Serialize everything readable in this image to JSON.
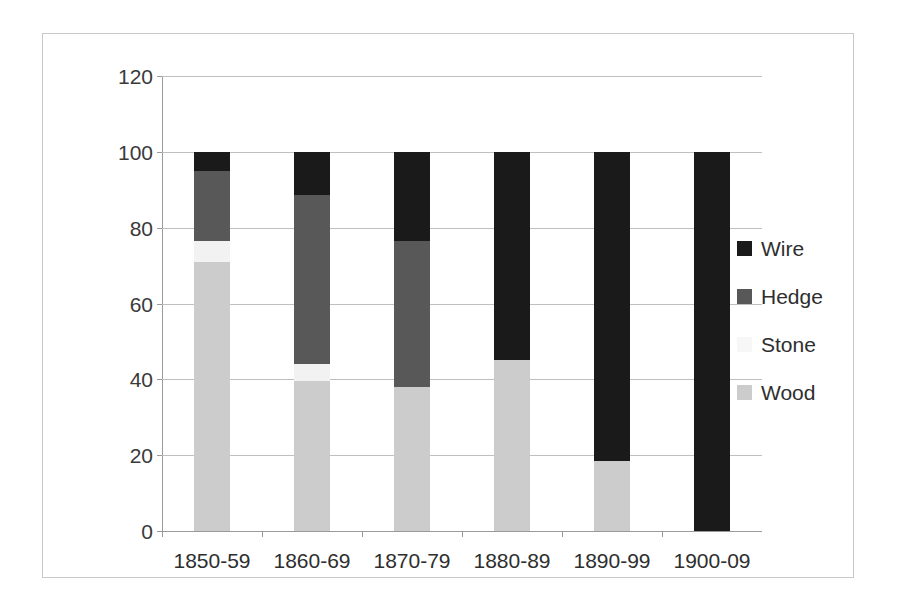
{
  "chart_data": {
    "type": "bar",
    "subtype": "stacked-bar",
    "title": "",
    "xlabel": "",
    "ylabel": "",
    "ylim": [
      0,
      120
    ],
    "yticks": [
      0,
      20,
      40,
      60,
      80,
      100,
      120
    ],
    "grid": true,
    "legend_position": "right",
    "categories": [
      "1850-59",
      "1860-69",
      "1870-79",
      "1880-89",
      "1890-99",
      "1900-09"
    ],
    "series": [
      {
        "name": "Wood",
        "color": "#cccccc",
        "values": [
          71,
          39.5,
          38,
          45,
          18.5,
          0
        ]
      },
      {
        "name": "Stone",
        "color": "#f2f2f2",
        "values": [
          5.5,
          4.5,
          0,
          0,
          0,
          0
        ]
      },
      {
        "name": "Hedge",
        "color": "#585858",
        "values": [
          18.5,
          44.5,
          38.5,
          0,
          0,
          0
        ]
      },
      {
        "name": "Wire",
        "color": "#1a1a1a",
        "values": [
          5,
          11.5,
          23.5,
          55,
          81.5,
          100
        ]
      }
    ],
    "legend_entries": [
      {
        "label": "Wire",
        "color": "#1a1a1a"
      },
      {
        "label": "Hedge",
        "color": "#585858"
      },
      {
        "label": "Stone",
        "color": "#f7f7f7"
      },
      {
        "label": "Wood",
        "color": "#cccccc"
      }
    ]
  },
  "colors": {
    "frame_border": "#c9c9c9",
    "gridline": "#bfbfbf",
    "axis": "#9a9a9a",
    "text": "#2e2e2e"
  }
}
